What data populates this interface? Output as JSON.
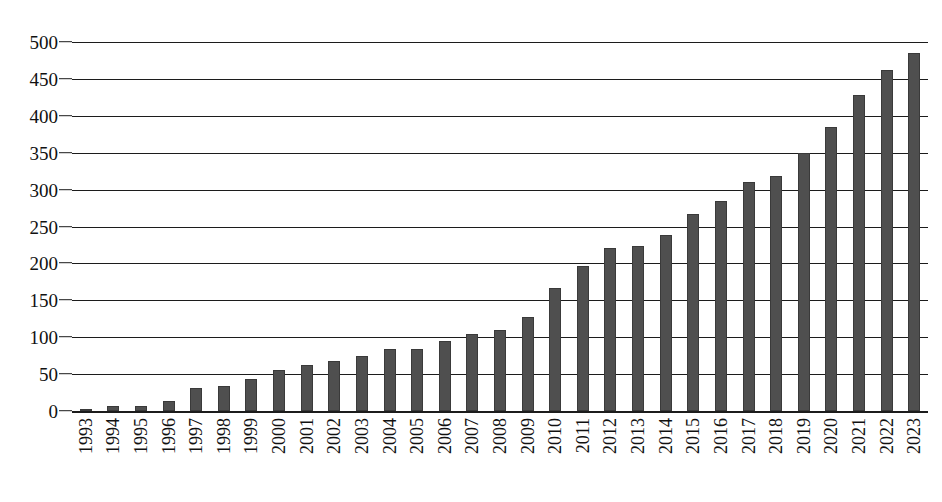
{
  "chart_data": {
    "type": "bar",
    "title": "",
    "subtitle": "",
    "xlabel": "",
    "ylabel": "",
    "ylim": [
      0,
      500
    ],
    "ytick_values": [
      0,
      50,
      100,
      150,
      200,
      250,
      300,
      350,
      400,
      450,
      500
    ],
    "ytick_labels": [
      "0",
      "50",
      "100",
      "150",
      "200",
      "250",
      "300",
      "350",
      "400",
      "450",
      "500"
    ],
    "grid": true,
    "legend": null,
    "legend_position": "none",
    "bar_color": "#4f4f4f",
    "axis_color": "#1c1c1c",
    "categories": [
      "1993",
      "1994",
      "1995",
      "1996",
      "1997",
      "1998",
      "1999",
      "2000",
      "2001",
      "2002",
      "2003",
      "2004",
      "2005",
      "2006",
      "2007",
      "2008",
      "2009",
      "2010",
      "2011",
      "2012",
      "2013",
      "2014",
      "2015",
      "2016",
      "2017",
      "2018",
      "2019",
      "2020",
      "2021",
      "2022",
      "2023"
    ],
    "values": [
      2,
      7,
      7,
      13,
      31,
      34,
      44,
      55,
      63,
      68,
      75,
      84,
      84,
      95,
      105,
      110,
      128,
      167,
      197,
      221,
      224,
      239,
      267,
      285,
      310,
      319,
      350,
      385,
      428,
      462,
      485
    ]
  }
}
